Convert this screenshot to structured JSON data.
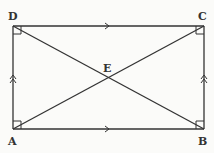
{
  "diagram": {
    "type": "rectangle with diagonals",
    "points": {
      "A": {
        "label": "A",
        "x": 13,
        "y": 129
      },
      "B": {
        "label": "B",
        "x": 204,
        "y": 129
      },
      "C": {
        "label": "C",
        "x": 204,
        "y": 26
      },
      "D": {
        "label": "D",
        "x": 13,
        "y": 26
      },
      "E": {
        "label": "E",
        "x": 108,
        "y": 77
      }
    },
    "segments": [
      "AB",
      "BC",
      "CD",
      "DA",
      "AC",
      "BD"
    ],
    "right_angles": [
      "A",
      "B",
      "C",
      "D"
    ],
    "parallel_marks": {
      "single_arrow": [
        "DC",
        "AB"
      ],
      "double_arrow": [
        "AD",
        "BC"
      ]
    },
    "colors": {
      "line": "#333333",
      "background": "#fbfbf9"
    }
  }
}
